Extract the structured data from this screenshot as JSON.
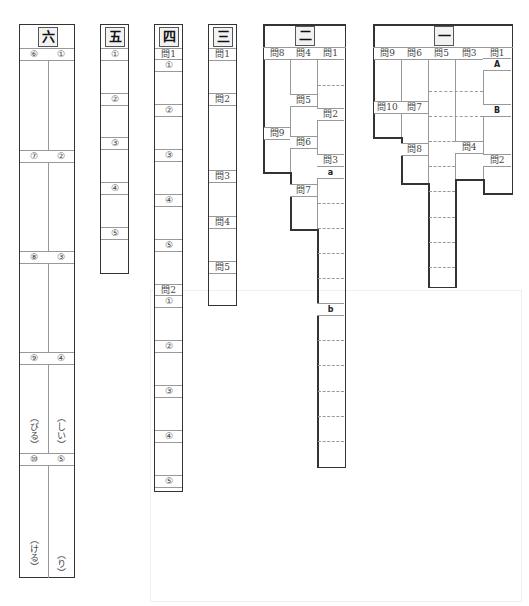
{
  "sections": {
    "six": {
      "title": "六",
      "labels": [
        "⑥",
        "①",
        "⑦",
        "②",
        "⑧",
        "③",
        "⑨",
        "④",
        "⑩",
        "⑤"
      ],
      "suffixes": [
        "（びる）",
        "（しい）",
        "（ける）",
        "（り）"
      ]
    },
    "five": {
      "title": "五",
      "labels": [
        "①",
        "②",
        "③",
        "④",
        "⑤"
      ]
    },
    "four": {
      "title": "四",
      "labels": [
        "問1",
        "①",
        "②",
        "③",
        "④",
        "⑤",
        "問2",
        "①",
        "②",
        "③",
        "④",
        "⑤"
      ]
    },
    "three": {
      "title": "三",
      "labels": [
        "問1",
        "問2",
        "問3",
        "問4",
        "問5"
      ]
    },
    "two": {
      "title": "二",
      "labels": [
        "問8",
        "問4",
        "問1",
        "問5",
        "問2",
        "問9",
        "問6",
        "問3",
        "a",
        "問7",
        "b"
      ]
    },
    "one": {
      "title": "一",
      "labels": [
        "問9",
        "問6",
        "問5",
        "問3",
        "問1",
        "A",
        "問10",
        "問7",
        "B",
        "問8",
        "問4",
        "問2"
      ]
    }
  }
}
